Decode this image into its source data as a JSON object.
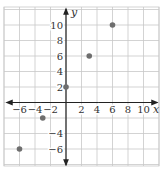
{
  "chart_data": {
    "type": "scatter",
    "title": "",
    "xlabel": "x",
    "ylabel": "y",
    "xlim": [
      -8,
      12
    ],
    "ylim": [
      -8,
      12
    ],
    "grid": true,
    "grid_step": 2,
    "x_ticks": [
      -6,
      -4,
      -2,
      2,
      4,
      6,
      8,
      10
    ],
    "x_tick_labels": [
      "−6",
      "−4",
      "−2",
      "2",
      "4",
      "6",
      "8",
      "10"
    ],
    "y_ticks": [
      -6,
      -4,
      2,
      4,
      6,
      8,
      10
    ],
    "y_tick_labels": [
      "−6",
      "−4",
      "2",
      "4",
      "6",
      "8",
      "10"
    ],
    "series": [
      {
        "name": "points",
        "points": [
          {
            "x": -6,
            "y": -6
          },
          {
            "x": -3,
            "y": -2
          },
          {
            "x": 0,
            "y": 2
          },
          {
            "x": 3,
            "y": 6
          },
          {
            "x": 6,
            "y": 10
          }
        ]
      }
    ],
    "legend": null
  },
  "colors": {
    "grid": "#c8c8c8",
    "axis": "#222222",
    "point": "#6e6e6e",
    "text": "#333333"
  }
}
